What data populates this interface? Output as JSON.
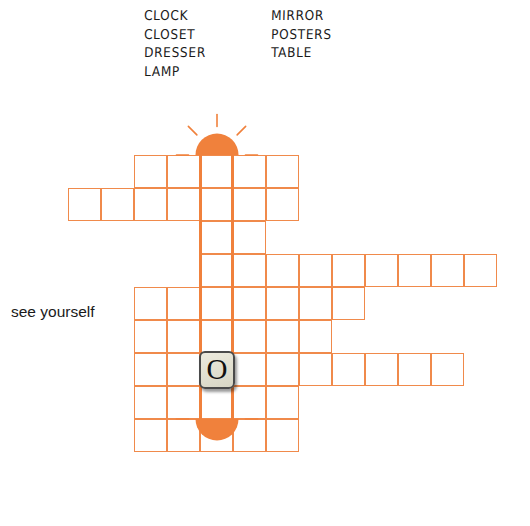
{
  "page": {
    "width": 530,
    "height": 526,
    "background": "#ffffff"
  },
  "colors": {
    "grid_line": "#F08A4B",
    "highlight": "#F0813C",
    "lamp": "#F0813C",
    "text": "#1a1a1a",
    "tile_face": "#e6e4d5",
    "tile_border": "#4a4a4a",
    "tile_letter": "#111111"
  },
  "wordlist": {
    "columns": [
      {
        "words": [
          "CLOCK",
          "CLOSET",
          "DRESSER",
          "LAMP"
        ]
      },
      {
        "words": [
          "MIRROR",
          "POSTERS",
          "TABLE"
        ]
      }
    ]
  },
  "clues": [
    {
      "text": "see yourself",
      "target": "MIRROR"
    }
  ],
  "tiles": [
    {
      "letter": "O",
      "col": 5,
      "row": 6
    }
  ],
  "lamps": [
    {
      "name": "lamp-top",
      "orientation": "up",
      "col": 5,
      "rays": 5
    },
    {
      "name": "lamp-bottom",
      "orientation": "down",
      "col": 5,
      "rays": 7
    }
  ],
  "highlight_column": {
    "col": 5,
    "word": "LAMP",
    "row_start": 0,
    "row_end": 8
  },
  "grid": {
    "origin_x": 35,
    "origin_y": 155,
    "cell_size": 33,
    "rows": [
      {
        "row": 0,
        "cols": [
          3,
          4,
          5,
          6,
          7
        ]
      },
      {
        "row": 1,
        "cols": [
          1,
          2,
          3,
          4,
          5,
          6,
          7
        ]
      },
      {
        "row": 2,
        "cols": [
          5,
          6
        ]
      },
      {
        "row": 3,
        "cols": [
          5,
          6,
          7,
          8,
          9,
          10,
          11,
          12,
          13
        ]
      },
      {
        "row": 4,
        "cols": [
          3,
          4,
          5,
          6,
          7,
          8,
          9
        ]
      },
      {
        "row": 5,
        "cols": [
          3,
          4,
          5,
          6,
          7,
          8
        ]
      },
      {
        "row": 6,
        "cols": [
          3,
          4,
          5,
          6,
          7,
          8,
          9,
          10,
          11,
          12
        ]
      },
      {
        "row": 7,
        "cols": [
          3,
          4,
          5,
          6,
          7
        ]
      },
      {
        "row": 8,
        "cols": [
          3,
          4,
          5,
          6,
          7
        ]
      }
    ]
  }
}
